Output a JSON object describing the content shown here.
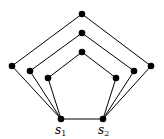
{
  "diagram": {
    "type": "graph",
    "nodes": [
      {
        "id": "top_outer",
        "x": 82,
        "y": 14
      },
      {
        "id": "top_mid",
        "x": 82,
        "y": 33
      },
      {
        "id": "top_inner",
        "x": 82,
        "y": 52
      },
      {
        "id": "left_outer",
        "x": 12,
        "y": 66
      },
      {
        "id": "right_outer",
        "x": 151,
        "y": 66
      },
      {
        "id": "left_mid",
        "x": 30,
        "y": 71
      },
      {
        "id": "right_mid",
        "x": 134,
        "y": 71
      },
      {
        "id": "left_inner",
        "x": 48,
        "y": 78
      },
      {
        "id": "right_inner",
        "x": 116,
        "y": 78
      },
      {
        "id": "s1",
        "x": 61,
        "y": 119,
        "label": "s",
        "subscript": "1"
      },
      {
        "id": "s2",
        "x": 103,
        "y": 119,
        "label": "s",
        "subscript": "2"
      }
    ],
    "edges": [
      [
        "s1",
        "s2"
      ],
      [
        "s1",
        "left_outer"
      ],
      [
        "left_outer",
        "top_outer"
      ],
      [
        "top_outer",
        "right_outer"
      ],
      [
        "right_outer",
        "s2"
      ],
      [
        "s1",
        "left_mid"
      ],
      [
        "left_mid",
        "top_mid"
      ],
      [
        "top_mid",
        "right_mid"
      ],
      [
        "right_mid",
        "s2"
      ],
      [
        "s1",
        "left_inner"
      ],
      [
        "left_inner",
        "top_inner"
      ],
      [
        "top_inner",
        "right_inner"
      ],
      [
        "right_inner",
        "s2"
      ]
    ],
    "labels": {
      "s1": {
        "base": "s",
        "sub": "1"
      },
      "s2": {
        "base": "s",
        "sub": "2"
      }
    }
  }
}
